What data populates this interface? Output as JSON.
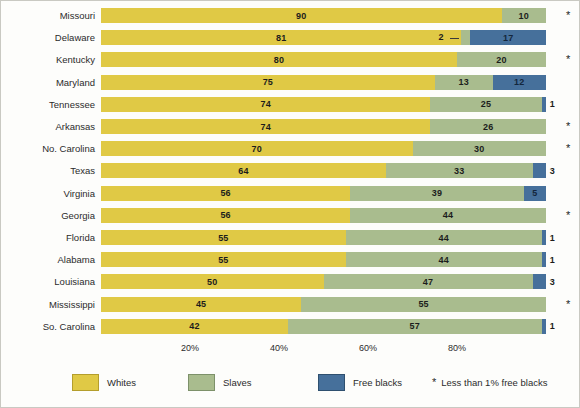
{
  "chart_data": {
    "type": "bar",
    "orientation": "horizontal",
    "stacked": true,
    "normalized_percent": true,
    "title": "",
    "xlabel": "",
    "ylabel": "",
    "xlim": [
      0,
      100
    ],
    "grid": false,
    "legend_position": "bottom",
    "categories": [
      "Missouri",
      "Delaware",
      "Kentucky",
      "Maryland",
      "Tennessee",
      "Arkansas",
      "No. Carolina",
      "Texas",
      "Virginia",
      "Georgia",
      "Florida",
      "Alabama",
      "Louisiana",
      "Mississippi",
      "So. Carolina"
    ],
    "series": [
      {
        "name": "Whites",
        "color": "#e0c945",
        "values": [
          90,
          81,
          80,
          75,
          74,
          74,
          70,
          64,
          56,
          56,
          55,
          55,
          50,
          45,
          42
        ]
      },
      {
        "name": "Slaves",
        "color": "#a9bc8e",
        "values": [
          10,
          2,
          20,
          13,
          25,
          26,
          30,
          33,
          39,
          44,
          44,
          44,
          47,
          55,
          57
        ]
      },
      {
        "name": "Free blacks",
        "color": "#46709b",
        "values": [
          0,
          17,
          0,
          12,
          1,
          0,
          0,
          3,
          5,
          0,
          1,
          1,
          3,
          0,
          1
        ]
      }
    ],
    "xticks": [
      20,
      40,
      60,
      80
    ],
    "xticklabels": [
      "20%",
      "40%",
      "60%",
      "80%"
    ],
    "rows": [
      {
        "state": "Missouri",
        "whites": 90,
        "slaves": 10,
        "free": 0,
        "free_label": "",
        "asterisk": true,
        "slaves_leader": false
      },
      {
        "state": "Delaware",
        "whites": 81,
        "slaves": 2,
        "free": 17,
        "free_label": "17",
        "asterisk": false,
        "slaves_leader": true
      },
      {
        "state": "Kentucky",
        "whites": 80,
        "slaves": 20,
        "free": 0,
        "free_label": "",
        "asterisk": true,
        "slaves_leader": false
      },
      {
        "state": "Maryland",
        "whites": 75,
        "slaves": 13,
        "free": 12,
        "free_label": "12",
        "asterisk": false,
        "slaves_leader": false
      },
      {
        "state": "Tennessee",
        "whites": 74,
        "slaves": 25,
        "free": 1,
        "free_label": "1",
        "asterisk": false,
        "slaves_leader": false
      },
      {
        "state": "Arkansas",
        "whites": 74,
        "slaves": 26,
        "free": 0,
        "free_label": "",
        "asterisk": true,
        "slaves_leader": false
      },
      {
        "state": "No. Carolina",
        "whites": 70,
        "slaves": 30,
        "free": 0,
        "free_label": "",
        "asterisk": true,
        "slaves_leader": false
      },
      {
        "state": "Texas",
        "whites": 64,
        "slaves": 33,
        "free": 3,
        "free_label": "3",
        "asterisk": false,
        "slaves_leader": false
      },
      {
        "state": "Virginia",
        "whites": 56,
        "slaves": 39,
        "free": 5,
        "free_label": "5",
        "asterisk": false,
        "slaves_leader": false
      },
      {
        "state": "Georgia",
        "whites": 56,
        "slaves": 44,
        "free": 0,
        "free_label": "",
        "asterisk": true,
        "slaves_leader": false
      },
      {
        "state": "Florida",
        "whites": 55,
        "slaves": 44,
        "free": 1,
        "free_label": "1",
        "asterisk": false,
        "slaves_leader": false
      },
      {
        "state": "Alabama",
        "whites": 55,
        "slaves": 44,
        "free": 1,
        "free_label": "1",
        "asterisk": false,
        "slaves_leader": false
      },
      {
        "state": "Louisiana",
        "whites": 50,
        "slaves": 47,
        "free": 3,
        "free_label": "3",
        "asterisk": false,
        "slaves_leader": false
      },
      {
        "state": "Mississippi",
        "whites": 45,
        "slaves": 55,
        "free": 0,
        "free_label": "",
        "asterisk": true,
        "slaves_leader": false
      },
      {
        "state": "So. Carolina",
        "whites": 42,
        "slaves": 57,
        "free": 1,
        "free_label": "1",
        "asterisk": false,
        "slaves_leader": false
      }
    ],
    "annotations": {
      "delaware_slaves_label": "2",
      "asterisk_glyph": "*"
    }
  },
  "legend": {
    "items": [
      {
        "label": "Whites",
        "color": "#e0c945"
      },
      {
        "label": "Slaves",
        "color": "#a9bc8e"
      },
      {
        "label": "Free blacks",
        "color": "#46709b"
      }
    ],
    "footnote_star": "*",
    "footnote": "Less than 1% free blacks"
  }
}
